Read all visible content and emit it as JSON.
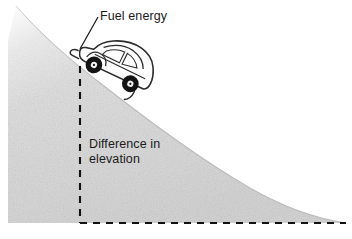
{
  "figure": {
    "title_visible": false,
    "background_color": "#ffffff",
    "width": 352,
    "height": 239
  },
  "labels": {
    "fuel_energy": "Fuel energy",
    "difference_in_elevation_line1": "Difference in",
    "difference_in_elevation_line2": "elevation"
  },
  "diagram": {
    "hill": {
      "name": "hillside-slope",
      "fill_color": "#dcdcdc",
      "edge_color": "#b4b4b4",
      "description_visible": false
    },
    "car": {
      "name": "beetle-car",
      "body_outline_color": "#2b2b2b",
      "body_fill_color": "#fdfdfd",
      "wheel_color": "#1a1a1a",
      "hub_color": "#f2f2f2"
    },
    "measurement": {
      "name": "elevation-measurement",
      "line_style": "dashed",
      "line_color": "#111111",
      "vertical_from_y": 66,
      "vertical_to_y": 223,
      "horizontal_from_x": 80,
      "horizontal_to_x": 346,
      "corner_x": 80,
      "corner_y": 223
    },
    "leader_line": {
      "name": "fuel-energy-leader",
      "color": "#1a1a1a",
      "from_x": 98,
      "from_y": 17,
      "to_x": 80,
      "to_y": 49
    }
  }
}
